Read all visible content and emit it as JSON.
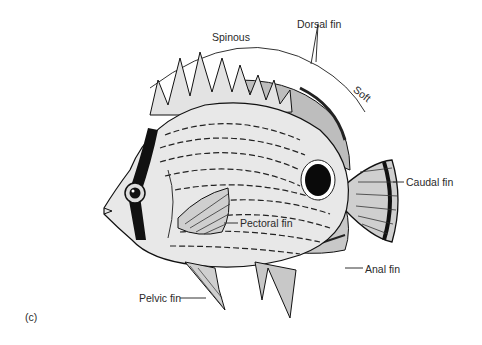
{
  "figure": {
    "panel_label": "(c)",
    "labels": {
      "dorsal_fin": "Dorsal fin",
      "spinous": "Spinous",
      "soft": "Soft",
      "caudal_fin": "Caudal fin",
      "pectoral_fin": "Pectoral fin",
      "anal_fin": "Anal fin",
      "pelvic_fin": "Pelvic fin"
    }
  },
  "colors": {
    "background": "#ffffff",
    "ink": "#1a1a1a",
    "body_fill": "#e6e6e6",
    "fin_fill": "#d0d0d0",
    "label_text": "#2a2a2a"
  }
}
